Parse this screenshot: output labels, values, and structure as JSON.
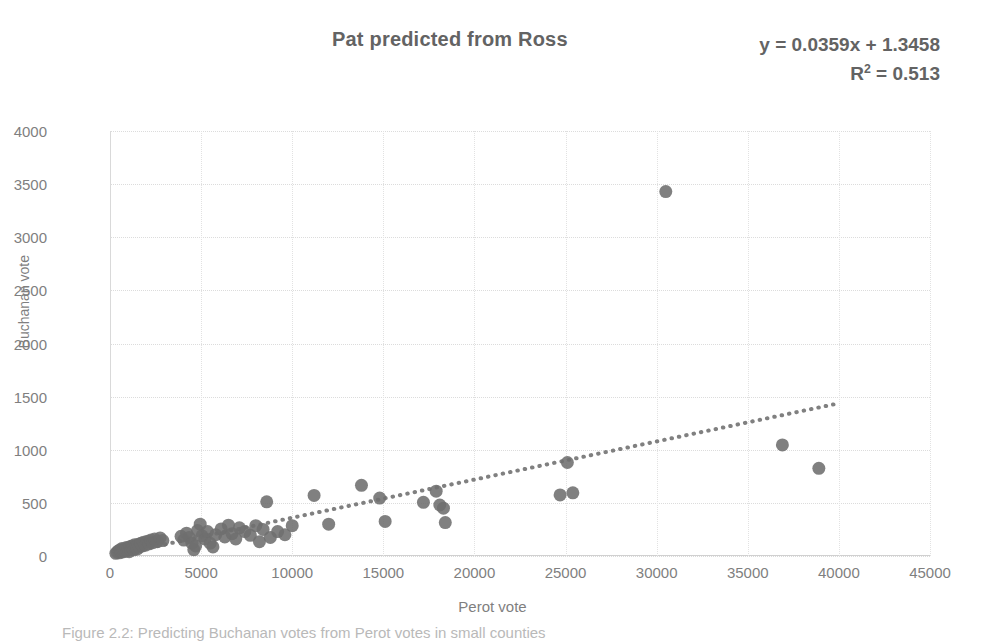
{
  "title": "Pat predicted from Ross",
  "equation": {
    "line1": "y = 0.0359x + 1.3458",
    "r2_prefix": "R",
    "r2_sup": "2",
    "r2_value": " = 0.513"
  },
  "caption": "Figure 2.2: Predicting Buchanan votes from Perot votes in small counties",
  "colors": {
    "marker": "#6e6e6e",
    "trendline": "#808080",
    "title": "#636363",
    "tick": "#7f7f7f",
    "grid": "#dcdcdc"
  },
  "chart_data": {
    "type": "scatter",
    "title": "Pat predicted from Ross",
    "xlabel": "Perot vote",
    "ylabel": "Buchanan vote",
    "xlim": [
      0,
      45000
    ],
    "ylim": [
      0,
      4000
    ],
    "xticks": [
      0,
      5000,
      10000,
      15000,
      20000,
      25000,
      30000,
      35000,
      40000,
      45000
    ],
    "yticks": [
      0,
      500,
      1000,
      1500,
      2000,
      2500,
      3000,
      3500,
      4000
    ],
    "grid": true,
    "legend": false,
    "annotations": [
      "y = 0.0359x + 1.3458",
      "R² = 0.513"
    ],
    "trendline": {
      "type": "linear-dotted",
      "slope": 0.0359,
      "intercept": 1.3458,
      "r2": 0.513,
      "x_start": 600,
      "x_end": 40000
    },
    "series": [
      {
        "name": "Counties",
        "marker": "circle",
        "color": "#6e6e6e",
        "points": [
          [
            320,
            25
          ],
          [
            400,
            35
          ],
          [
            450,
            48
          ],
          [
            520,
            30
          ],
          [
            560,
            60
          ],
          [
            610,
            42
          ],
          [
            660,
            70
          ],
          [
            700,
            38
          ],
          [
            740,
            55
          ],
          [
            800,
            65
          ],
          [
            850,
            45
          ],
          [
            900,
            80
          ],
          [
            950,
            52
          ],
          [
            1000,
            72
          ],
          [
            1050,
            40
          ],
          [
            1100,
            88
          ],
          [
            1150,
            60
          ],
          [
            1200,
            95
          ],
          [
            1250,
            70
          ],
          [
            1300,
            58
          ],
          [
            1350,
            105
          ],
          [
            1400,
            78
          ],
          [
            1450,
            92
          ],
          [
            1500,
            66
          ],
          [
            1550,
            110
          ],
          [
            1620,
            85
          ],
          [
            1700,
            120
          ],
          [
            1780,
            95
          ],
          [
            1850,
            130
          ],
          [
            1950,
            102
          ],
          [
            2050,
            140
          ],
          [
            2150,
            115
          ],
          [
            2250,
            150
          ],
          [
            2350,
            125
          ],
          [
            2450,
            160
          ],
          [
            2600,
            135
          ],
          [
            2750,
            170
          ],
          [
            2900,
            145
          ],
          [
            3900,
            185
          ],
          [
            4050,
            150
          ],
          [
            4200,
            215
          ],
          [
            4350,
            175
          ],
          [
            4500,
            120
          ],
          [
            4600,
            60
          ],
          [
            4700,
            95
          ],
          [
            4800,
            240
          ],
          [
            4950,
            300
          ],
          [
            5050,
            190
          ],
          [
            5200,
            160
          ],
          [
            5350,
            230
          ],
          [
            5500,
            120
          ],
          [
            5650,
            85
          ],
          [
            5800,
            200
          ],
          [
            6100,
            255
          ],
          [
            6300,
            180
          ],
          [
            6500,
            290
          ],
          [
            6700,
            210
          ],
          [
            6900,
            160
          ],
          [
            7100,
            265
          ],
          [
            7400,
            230
          ],
          [
            7700,
            195
          ],
          [
            8000,
            285
          ],
          [
            8200,
            135
          ],
          [
            8400,
            250
          ],
          [
            8600,
            510
          ],
          [
            8800,
            175
          ],
          [
            9200,
            230
          ],
          [
            9600,
            200
          ],
          [
            10000,
            285
          ],
          [
            11200,
            570
          ],
          [
            12000,
            300
          ],
          [
            13800,
            665
          ],
          [
            14800,
            545
          ],
          [
            15100,
            325
          ],
          [
            17200,
            505
          ],
          [
            17900,
            610
          ],
          [
            18100,
            480
          ],
          [
            18300,
            450
          ],
          [
            18400,
            315
          ],
          [
            24700,
            575
          ],
          [
            25100,
            880
          ],
          [
            25400,
            595
          ],
          [
            30500,
            3430
          ],
          [
            36900,
            1045
          ],
          [
            38900,
            825
          ]
        ]
      }
    ]
  }
}
